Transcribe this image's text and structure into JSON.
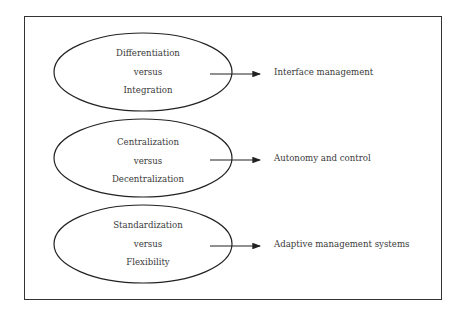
{
  "diagram": {
    "rows": [
      {
        "top": "Differentiation",
        "middle": "versus",
        "bottom": "Integration",
        "outcome": "Interface management"
      },
      {
        "top": "Centralization",
        "middle": "versus",
        "bottom": "Decentralization",
        "outcome": "Autonomy and control"
      },
      {
        "top": "Standardization",
        "middle": "versus",
        "bottom": "Flexibility",
        "outcome": "Adaptive management systems"
      }
    ],
    "colors": {
      "line": "#222222",
      "text": "#3a3a3a",
      "background": "#ffffff"
    }
  }
}
